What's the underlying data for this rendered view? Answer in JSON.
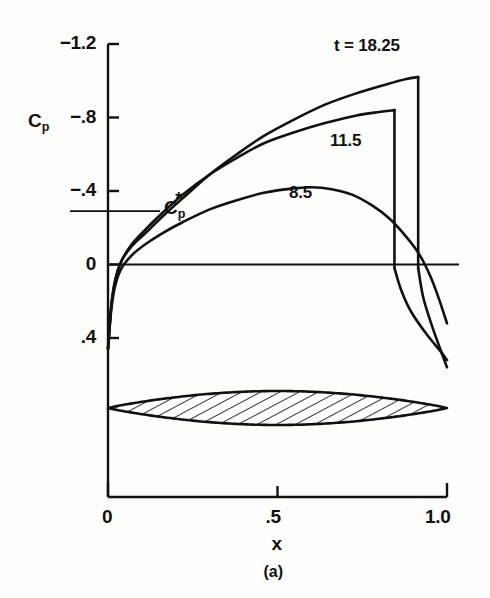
{
  "figure": {
    "caption": "(a)",
    "background_color": "#fdfdfb",
    "ink_color": "#111111"
  },
  "axes": {
    "y_title": "C",
    "y_title_sub": "p",
    "x_title": "x",
    "y_ticks": [
      {
        "label": "−1.2",
        "value": -1.2
      },
      {
        "label": "−.8",
        "value": -0.8
      },
      {
        "label": "−.4",
        "value": -0.4
      },
      {
        "label": "0",
        "value": 0
      },
      {
        "label": ".4",
        "value": 0.4
      }
    ],
    "x_ticks": [
      {
        "label": "0",
        "value": 0
      },
      {
        "label": ".5",
        "value": 0.5
      },
      {
        "label": "1.0",
        "value": 1.0
      }
    ]
  },
  "annotations": {
    "cp_star": {
      "label_main": "C",
      "label_sub": "p",
      "label_sup": "*",
      "value": -0.29
    },
    "series_labels": [
      {
        "text": "t = 18.25",
        "x": 0.78,
        "y": -1.16
      },
      {
        "text": "11.5",
        "x": 0.7,
        "y": -0.62
      },
      {
        "text": "8.5",
        "x": 0.58,
        "y": -0.32
      }
    ]
  },
  "airfoil": {
    "name": "symmetric-lens-airfoil",
    "chord_start": 0.0,
    "chord_end": 1.0,
    "max_thickness": 0.06,
    "hatch_angle_deg": 60,
    "fill": "#ffffff",
    "outline": "#111111"
  },
  "chart_data": {
    "type": "line",
    "title": "",
    "xlabel": "x",
    "ylabel": "Cp",
    "xlim": [
      0.0,
      1.0
    ],
    "ylim": [
      0.55,
      -1.25
    ],
    "y_axis_inverted": true,
    "grid": false,
    "legend": "inline-curve-labels",
    "reference_lines": [
      {
        "name": "zero-line",
        "axis": "y",
        "value": 0.0
      },
      {
        "name": "cp-star-line",
        "axis": "y",
        "value": -0.29
      }
    ],
    "series": [
      {
        "name": "t = 18.25",
        "shock_location": 0.915,
        "peak_cp": -1.02,
        "points": [
          [
            0.0,
            0.46
          ],
          [
            0.01,
            0.22
          ],
          [
            0.022,
            0.08
          ],
          [
            0.04,
            -0.02
          ],
          [
            0.07,
            -0.1
          ],
          [
            0.11,
            -0.17
          ],
          [
            0.16,
            -0.26
          ],
          [
            0.22,
            -0.36
          ],
          [
            0.3,
            -0.49
          ],
          [
            0.38,
            -0.6
          ],
          [
            0.46,
            -0.7
          ],
          [
            0.55,
            -0.79
          ],
          [
            0.64,
            -0.87
          ],
          [
            0.73,
            -0.93
          ],
          [
            0.82,
            -0.98
          ],
          [
            0.88,
            -1.01
          ],
          [
            0.915,
            -1.02
          ],
          [
            0.915,
            0.02
          ],
          [
            0.93,
            0.18
          ],
          [
            0.955,
            0.33
          ],
          [
            0.98,
            0.46
          ],
          [
            1.0,
            0.56
          ]
        ]
      },
      {
        "name": "11.5",
        "shock_location": 0.845,
        "peak_cp": -0.84,
        "points": [
          [
            0.0,
            0.46
          ],
          [
            0.01,
            0.22
          ],
          [
            0.022,
            0.08
          ],
          [
            0.04,
            -0.02
          ],
          [
            0.07,
            -0.11
          ],
          [
            0.11,
            -0.19
          ],
          [
            0.16,
            -0.28
          ],
          [
            0.22,
            -0.38
          ],
          [
            0.3,
            -0.49
          ],
          [
            0.38,
            -0.58
          ],
          [
            0.46,
            -0.66
          ],
          [
            0.55,
            -0.72
          ],
          [
            0.64,
            -0.77
          ],
          [
            0.73,
            -0.81
          ],
          [
            0.8,
            -0.83
          ],
          [
            0.845,
            -0.84
          ],
          [
            0.845,
            0.02
          ],
          [
            0.865,
            0.14
          ],
          [
            0.895,
            0.26
          ],
          [
            0.94,
            0.38
          ],
          [
            0.98,
            0.47
          ],
          [
            1.0,
            0.52
          ]
        ]
      },
      {
        "name": "8.5",
        "shock_location": null,
        "peak_cp": -0.42,
        "points": [
          [
            0.0,
            0.46
          ],
          [
            0.01,
            0.24
          ],
          [
            0.022,
            0.11
          ],
          [
            0.04,
            0.02
          ],
          [
            0.07,
            -0.05
          ],
          [
            0.11,
            -0.11
          ],
          [
            0.16,
            -0.17
          ],
          [
            0.22,
            -0.23
          ],
          [
            0.3,
            -0.3
          ],
          [
            0.38,
            -0.35
          ],
          [
            0.46,
            -0.39
          ],
          [
            0.53,
            -0.41
          ],
          [
            0.6,
            -0.42
          ],
          [
            0.66,
            -0.41
          ],
          [
            0.72,
            -0.38
          ],
          [
            0.78,
            -0.32
          ],
          [
            0.83,
            -0.25
          ],
          [
            0.88,
            -0.15
          ],
          [
            0.92,
            -0.05
          ],
          [
            0.95,
            0.06
          ],
          [
            0.975,
            0.18
          ],
          [
            1.0,
            0.32
          ]
        ]
      }
    ]
  }
}
